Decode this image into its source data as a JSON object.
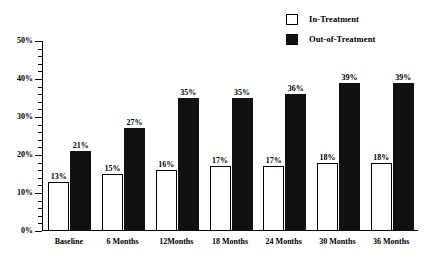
{
  "chart_data": {
    "type": "bar",
    "title": "",
    "subtitle": "",
    "xlabel": "",
    "ylabel": "",
    "ylim": [
      0,
      50
    ],
    "ytick_labels": [
      "0%",
      "10%",
      "20%",
      "30%",
      "40%",
      "50%"
    ],
    "ytick_values": [
      0,
      10,
      20,
      30,
      40,
      50
    ],
    "minor_tick_step": 2,
    "grid": false,
    "legend_position": "top-right",
    "value_suffix": "%",
    "categories": [
      "Baseline",
      "6 Months",
      "12Months",
      "18 Months",
      "24 Months",
      "30 Months",
      "36 Months"
    ],
    "series": [
      {
        "name": "In-Treatment",
        "style": "hollow",
        "color": "#ffffff",
        "edge_color": "#000000",
        "values": [
          13,
          15,
          16,
          17,
          17,
          18,
          18
        ],
        "labels": [
          "13%",
          "15%",
          "16%",
          "17%",
          "17%",
          "18%",
          "18%"
        ]
      },
      {
        "name": "Out-of-Treatment",
        "style": "filled",
        "color": "#111111",
        "edge_color": "#111111",
        "values": [
          21,
          27,
          35,
          35,
          36,
          39,
          39
        ],
        "labels": [
          "21%",
          "27%",
          "35%",
          "35%",
          "36%",
          "39%",
          "39%"
        ]
      }
    ]
  },
  "legend": {
    "items": [
      {
        "label": "In-Treatment",
        "swatch": "hollow"
      },
      {
        "label": "Out-of-Treatment",
        "swatch": "filled"
      }
    ]
  },
  "colors": {
    "axis": "#000000",
    "text": "#000000",
    "background": "#ffffff",
    "filled_bar": "#111111",
    "hollow_bar": "#ffffff"
  }
}
